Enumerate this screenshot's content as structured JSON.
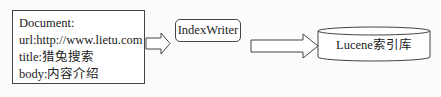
{
  "diagram": {
    "document": {
      "lines": [
        "Document:",
        "url:http://www.lietu.com",
        "title:猎兔搜索",
        "body:内容介绍"
      ]
    },
    "writer": {
      "label": "IndexWriter"
    },
    "index": {
      "label": "Lucene索引库"
    },
    "edges": [
      {
        "from": "Document",
        "to": "IndexWriter",
        "style": "block-arrow"
      },
      {
        "from": "IndexWriter",
        "to": "Lucene索引库",
        "style": "block-arrow"
      }
    ],
    "colors": {
      "stroke": "#444444",
      "fill": "#ffffff",
      "background": "#fbfbfb"
    }
  }
}
